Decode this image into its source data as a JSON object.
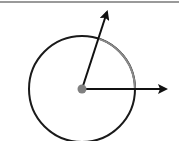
{
  "diagram": {
    "type": "vector-rotation-circle",
    "circle": {
      "cx": 82,
      "cy": 89,
      "r": 53,
      "stroke": "#1a1a1a",
      "arc_highlight_stroke": "#8a8a8a"
    },
    "center_dot": {
      "cx": 82,
      "cy": 89,
      "r": 4.5,
      "fill": "#808080"
    },
    "vectors": [
      {
        "name": "vector-rotated",
        "x1": 82,
        "y1": 89,
        "x2": 107,
        "y2": 12,
        "color": "#111111"
      },
      {
        "name": "vector-horizontal",
        "x1": 82,
        "y1": 89,
        "x2": 166,
        "y2": 89,
        "color": "#111111"
      }
    ],
    "top_rule_color": "#9a9a9a"
  }
}
